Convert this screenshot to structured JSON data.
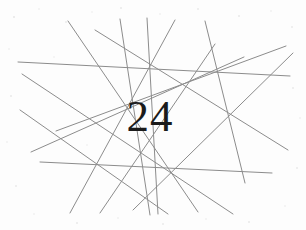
{
  "captcha": {
    "code": "24",
    "width": 306,
    "height": 230,
    "background_color": "#fdfdfd",
    "code_color": "#1b1b1b",
    "line_color": "#8c8c8c",
    "line_width": 1,
    "noise_color": "#d8d8d8",
    "line_count": 14,
    "lines": [
      {
        "x1": 18,
        "y1": 62,
        "x2": 290,
        "y2": 76
      },
      {
        "x1": 40,
        "y1": 162,
        "x2": 272,
        "y2": 173
      },
      {
        "x1": 22,
        "y1": 74,
        "x2": 233,
        "y2": 214
      },
      {
        "x1": 20,
        "y1": 110,
        "x2": 168,
        "y2": 214
      },
      {
        "x1": 31,
        "y1": 152,
        "x2": 244,
        "y2": 57
      },
      {
        "x1": 70,
        "y1": 213,
        "x2": 175,
        "y2": 20
      },
      {
        "x1": 100,
        "y1": 213,
        "x2": 215,
        "y2": 44
      },
      {
        "x1": 68,
        "y1": 21,
        "x2": 198,
        "y2": 212
      },
      {
        "x1": 95,
        "y1": 30,
        "x2": 288,
        "y2": 150
      },
      {
        "x1": 120,
        "y1": 19,
        "x2": 150,
        "y2": 215
      },
      {
        "x1": 147,
        "y1": 18,
        "x2": 158,
        "y2": 214
      },
      {
        "x1": 133,
        "y1": 210,
        "x2": 293,
        "y2": 53
      },
      {
        "x1": 56,
        "y1": 131,
        "x2": 286,
        "y2": 46
      },
      {
        "x1": 205,
        "y1": 21,
        "x2": 245,
        "y2": 183
      }
    ],
    "noise_specks": [
      {
        "cx": 14,
        "cy": 17,
        "r": 1.1
      },
      {
        "cx": 39,
        "cy": 9,
        "r": 0.8
      },
      {
        "cx": 66,
        "cy": 22,
        "r": 0.9
      },
      {
        "cx": 92,
        "cy": 12,
        "r": 0.7
      },
      {
        "cx": 121,
        "cy": 8,
        "r": 1.0
      },
      {
        "cx": 160,
        "cy": 14,
        "r": 0.8
      },
      {
        "cx": 198,
        "cy": 9,
        "r": 0.9
      },
      {
        "cx": 239,
        "cy": 16,
        "r": 1.0
      },
      {
        "cx": 271,
        "cy": 11,
        "r": 0.8
      },
      {
        "cx": 292,
        "cy": 27,
        "r": 0.9
      },
      {
        "cx": 9,
        "cy": 49,
        "r": 0.8
      },
      {
        "cx": 11,
        "cy": 96,
        "r": 1.0
      },
      {
        "cx": 7,
        "cy": 142,
        "r": 0.8
      },
      {
        "cx": 16,
        "cy": 186,
        "r": 0.9
      },
      {
        "cx": 34,
        "cy": 214,
        "r": 0.8
      },
      {
        "cx": 77,
        "cy": 223,
        "r": 1.0
      },
      {
        "cx": 118,
        "cy": 218,
        "r": 0.8
      },
      {
        "cx": 163,
        "cy": 224,
        "r": 0.9
      },
      {
        "cx": 206,
        "cy": 219,
        "r": 0.8
      },
      {
        "cx": 249,
        "cy": 222,
        "r": 1.0
      },
      {
        "cx": 285,
        "cy": 206,
        "r": 0.8
      },
      {
        "cx": 297,
        "cy": 168,
        "r": 0.9
      },
      {
        "cx": 300,
        "cy": 118,
        "r": 0.8
      },
      {
        "cx": 293,
        "cy": 88,
        "r": 0.9
      },
      {
        "cx": 54,
        "cy": 57,
        "r": 0.7
      },
      {
        "cx": 228,
        "cy": 111,
        "r": 0.7
      },
      {
        "cx": 176,
        "cy": 176,
        "r": 0.7
      },
      {
        "cx": 87,
        "cy": 145,
        "r": 0.7
      }
    ]
  }
}
